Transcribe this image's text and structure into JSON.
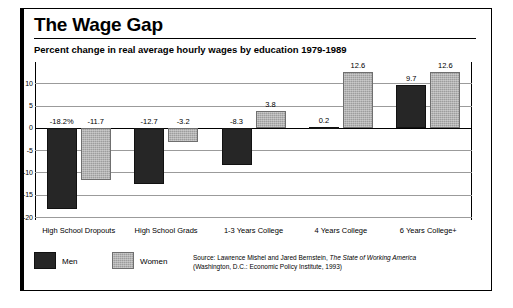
{
  "figure": {
    "title": "The Wage Gap",
    "subtitle": "Percent change in real average hourly wages by education 1979-1989",
    "source_line1_prefix": "Source: Lawrence Mishel and Jared Bernstein, ",
    "source_line1_italic": "The State of Working America",
    "source_line2": "(Washington, D.C.: Economic Policy Institute, 1993)"
  },
  "legend": {
    "items": [
      {
        "label": "Men",
        "color": "#262626"
      },
      {
        "label": "Women",
        "color": "#9d9d9d"
      }
    ]
  },
  "chart_data": {
    "type": "bar",
    "title": "The Wage Gap",
    "subtitle": "Percent change in real average hourly wages by education 1979-1989",
    "xlabel": "",
    "ylabel": "",
    "ylim": [
      -20,
      13
    ],
    "yticks": [
      10,
      5,
      0,
      -5,
      -10,
      -15,
      -20
    ],
    "ytick_labels": [
      "10",
      "5",
      "0",
      "-5",
      "-10",
      "-15",
      "-20"
    ],
    "grid": true,
    "legend_position": "below-left",
    "categories": [
      "High School Dropouts",
      "High School Grads",
      "1-3 Years College",
      "4 Years College",
      "6 Years College+"
    ],
    "series": [
      {
        "name": "Men",
        "color": "#262626",
        "values": [
          -18.2,
          -12.7,
          -8.3,
          0.2,
          9.7
        ],
        "data_labels": [
          "-18.2%",
          "-12.7",
          "-8.3",
          "0.2",
          "9.7"
        ]
      },
      {
        "name": "Women",
        "color": "#9d9d9d",
        "values": [
          -11.7,
          -3.2,
          3.8,
          12.6,
          12.6
        ],
        "data_labels": [
          "-11.7",
          "-3.2",
          "3.8",
          "12.6",
          "12.6"
        ]
      }
    ]
  }
}
